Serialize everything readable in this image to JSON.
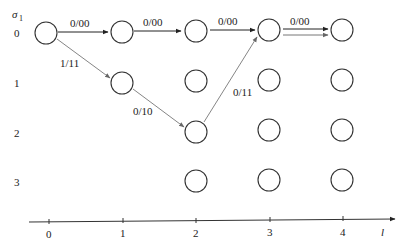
{
  "diagram": {
    "type": "trellis",
    "y_axis_label": "σ",
    "y_axis_subscript": "1",
    "rows": [
      {
        "state": "0",
        "y": 33
      },
      {
        "state": "1",
        "y": 83
      },
      {
        "state": "2",
        "y": 132
      },
      {
        "state": "3",
        "y": 181
      }
    ],
    "columns": [
      {
        "t": "0",
        "x": 46
      },
      {
        "t": "1",
        "x": 122
      },
      {
        "t": "2",
        "x": 196
      },
      {
        "t": "3",
        "x": 270
      },
      {
        "t": "4",
        "x": 343
      }
    ],
    "x_axis": {
      "label": "l",
      "ticks": [
        "0",
        "1",
        "2",
        "3",
        "4"
      ]
    },
    "nodes": [
      {
        "col": 0,
        "row": 0
      },
      {
        "col": 1,
        "row": 0
      },
      {
        "col": 1,
        "row": 1
      },
      {
        "col": 2,
        "row": 0
      },
      {
        "col": 2,
        "row": 1
      },
      {
        "col": 2,
        "row": 2
      },
      {
        "col": 2,
        "row": 3
      },
      {
        "col": 3,
        "row": 0
      },
      {
        "col": 3,
        "row": 1
      },
      {
        "col": 3,
        "row": 2
      },
      {
        "col": 3,
        "row": 3
      },
      {
        "col": 4,
        "row": 0
      },
      {
        "col": 4,
        "row": 1
      },
      {
        "col": 4,
        "row": 2
      },
      {
        "col": 4,
        "row": 3
      }
    ],
    "edges": [
      {
        "from": [
          0,
          0
        ],
        "to": [
          1,
          0
        ],
        "label": "0/00",
        "color": "#222222"
      },
      {
        "from": [
          1,
          0
        ],
        "to": [
          2,
          0
        ],
        "label": "0/00",
        "color": "#222222"
      },
      {
        "from": [
          2,
          0
        ],
        "to": [
          3,
          0
        ],
        "label": "0/00",
        "color": "#222222"
      },
      {
        "from": [
          3,
          0
        ],
        "to": [
          4,
          0
        ],
        "label": "0/00",
        "color": "#222222"
      },
      {
        "from": [
          3,
          0
        ],
        "to": [
          4,
          0
        ],
        "label": "",
        "color": "#777777"
      },
      {
        "from": [
          0,
          0
        ],
        "to": [
          1,
          1
        ],
        "label": "1/11",
        "color": "#777777"
      },
      {
        "from": [
          1,
          1
        ],
        "to": [
          2,
          2
        ],
        "label": "0/10",
        "color": "#777777"
      },
      {
        "from": [
          2,
          2
        ],
        "to": [
          3,
          0
        ],
        "label": "0/11",
        "color": "#777777"
      }
    ]
  }
}
